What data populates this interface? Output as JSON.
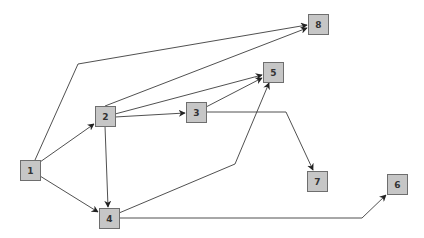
{
  "diagram": {
    "type": "directed-graph",
    "colors": {
      "node_fill": "#c6c6c6",
      "node_border": "#6e6e6e",
      "edge": "#3c3c3c",
      "background": "#ffffff"
    },
    "nodes": [
      {
        "id": "1",
        "label": "1",
        "x": 20,
        "y": 160,
        "w": 20,
        "h": 20
      },
      {
        "id": "2",
        "label": "2",
        "x": 95,
        "y": 106,
        "w": 20,
        "h": 20
      },
      {
        "id": "3",
        "label": "3",
        "x": 186,
        "y": 102,
        "w": 20,
        "h": 20
      },
      {
        "id": "4",
        "label": "4",
        "x": 99,
        "y": 208,
        "w": 20,
        "h": 20
      },
      {
        "id": "5",
        "label": "5",
        "x": 263,
        "y": 62,
        "w": 20,
        "h": 20
      },
      {
        "id": "6",
        "label": "6",
        "x": 387,
        "y": 174,
        "w": 20,
        "h": 20
      },
      {
        "id": "7",
        "label": "7",
        "x": 307,
        "y": 171,
        "w": 20,
        "h": 20
      },
      {
        "id": "8",
        "label": "8",
        "x": 308,
        "y": 14,
        "w": 20,
        "h": 20
      }
    ],
    "edges": [
      {
        "from": "1",
        "to": "8",
        "points": [
          [
            35,
            160
          ],
          [
            78,
            64
          ],
          [
            307,
            25
          ]
        ]
      },
      {
        "from": "1",
        "to": "2",
        "points": [
          [
            40,
            162
          ],
          [
            94,
            124
          ]
        ]
      },
      {
        "from": "1",
        "to": "4",
        "points": [
          [
            40,
            176
          ],
          [
            98,
            212
          ]
        ]
      },
      {
        "from": "2",
        "to": "8",
        "points": [
          [
            105,
            106
          ],
          [
            307,
            28
          ]
        ]
      },
      {
        "from": "2",
        "to": "5",
        "points": [
          [
            115,
            114
          ],
          [
            262,
            75
          ]
        ]
      },
      {
        "from": "2",
        "to": "3",
        "points": [
          [
            115,
            117
          ],
          [
            185,
            113
          ]
        ]
      },
      {
        "from": "2",
        "to": "4",
        "points": [
          [
            105,
            126
          ],
          [
            108,
            207
          ]
        ]
      },
      {
        "from": "3",
        "to": "5",
        "points": [
          [
            206,
            107
          ],
          [
            262,
            78
          ]
        ]
      },
      {
        "from": "3",
        "to": "7",
        "points": [
          [
            206,
            112
          ],
          [
            286,
            112
          ],
          [
            313,
            170
          ]
        ]
      },
      {
        "from": "4",
        "to": "5",
        "points": [
          [
            119,
            213
          ],
          [
            235,
            164
          ],
          [
            269,
            83
          ]
        ]
      },
      {
        "from": "4",
        "to": "6",
        "points": [
          [
            119,
            218
          ],
          [
            362,
            218
          ],
          [
            386,
            195
          ]
        ]
      }
    ]
  }
}
